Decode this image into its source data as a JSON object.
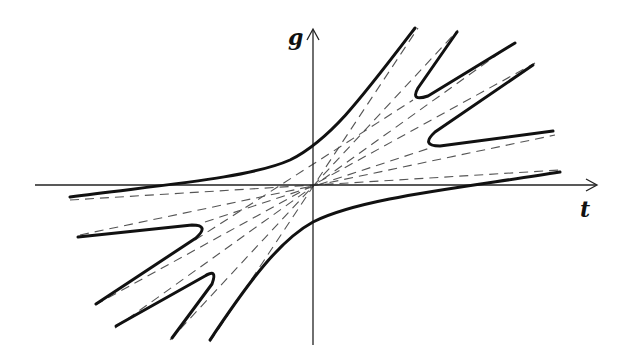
{
  "diagram": {
    "type": "curve-family-with-asymptotes",
    "axes": {
      "horizontal_label": "t",
      "vertical_label": "g",
      "origin_px": [
        313,
        185
      ]
    },
    "colors": {
      "curve": "#111111",
      "asymptote": "#555555",
      "axis": "#222222",
      "background": "#ffffff"
    },
    "solid_curves": [
      {
        "name": "upper-main-branch",
        "path": "M70,197 C160,185 250,178 290,160 C330,140 360,100 415,28"
      },
      {
        "name": "lower-main-branch",
        "path": "M210,340 C250,280 280,240 313,222 C360,198 460,188 560,172"
      },
      {
        "name": "upper-right-v-outer",
        "path": "M457,32 L418,88 Q410,102 428,96 L515,43"
      },
      {
        "name": "upper-right-v-inner",
        "path": "M533,65 L435,132 Q420,146 440,146 L553,131"
      },
      {
        "name": "lower-left-v-outer",
        "path": "M78,237 L192,225 Q210,225 196,238 L96,304"
      },
      {
        "name": "lower-left-v-inner",
        "path": "M116,326 L205,276 Q218,268 212,284 L172,338"
      }
    ],
    "asymptotes": [
      {
        "x1": 70,
        "y1": 200,
        "x2": 560,
        "y2": 170
      },
      {
        "x1": 80,
        "y1": 235,
        "x2": 555,
        "y2": 135
      },
      {
        "x1": 95,
        "y1": 305,
        "x2": 535,
        "y2": 63
      },
      {
        "x1": 115,
        "y1": 328,
        "x2": 515,
        "y2": 42
      },
      {
        "x1": 170,
        "y1": 340,
        "x2": 458,
        "y2": 30
      },
      {
        "x1": 210,
        "y1": 342,
        "x2": 418,
        "y2": 28
      },
      {
        "x1": 205,
        "y1": 222,
        "x2": 430,
        "y2": 148
      },
      {
        "x1": 195,
        "y1": 240,
        "x2": 413,
        "y2": 100
      }
    ]
  }
}
